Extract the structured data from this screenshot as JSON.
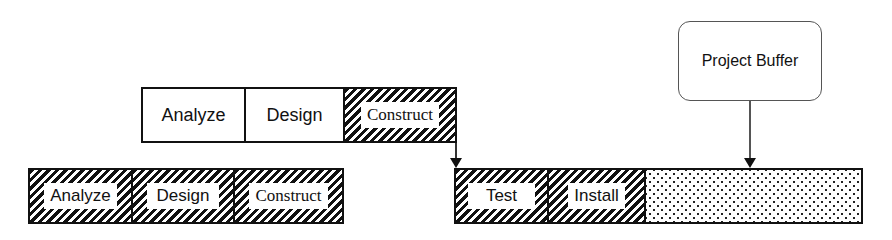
{
  "diagram": {
    "type": "critical-chain-schedule",
    "top_chain": {
      "tasks": [
        {
          "label": "Analyze",
          "style": "plain"
        },
        {
          "label": "Design",
          "style": "plain"
        },
        {
          "label": "Construct",
          "style": "hatched"
        }
      ]
    },
    "bottom_left_chain": {
      "tasks": [
        {
          "label": "Analyze",
          "style": "hatched"
        },
        {
          "label": "Design",
          "style": "hatched"
        },
        {
          "label": "Construct",
          "style": "hatched"
        }
      ]
    },
    "bottom_right_chain": {
      "tasks": [
        {
          "label": "Test",
          "style": "hatched"
        },
        {
          "label": "Install",
          "style": "hatched"
        },
        {
          "label": "",
          "style": "dotted-buffer"
        }
      ]
    },
    "callout": {
      "label": "Project Buffer"
    }
  }
}
